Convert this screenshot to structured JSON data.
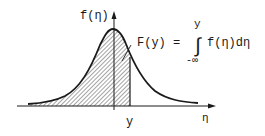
{
  "diagram": {
    "type": "probability-density-curve",
    "colors": {
      "ink": "#1a1a1a",
      "background": "#ffffff"
    },
    "y_axis_label": "f(η)",
    "x_axis_label": "η",
    "x_marker_label": "y",
    "annotation": {
      "lhs": "F(y) =",
      "integral_symbol": "∫",
      "upper_limit": "y",
      "lower_limit": "-∞",
      "integrand": "f(η)dη"
    },
    "shaded_region": "area under f(η) from -∞ to y"
  }
}
